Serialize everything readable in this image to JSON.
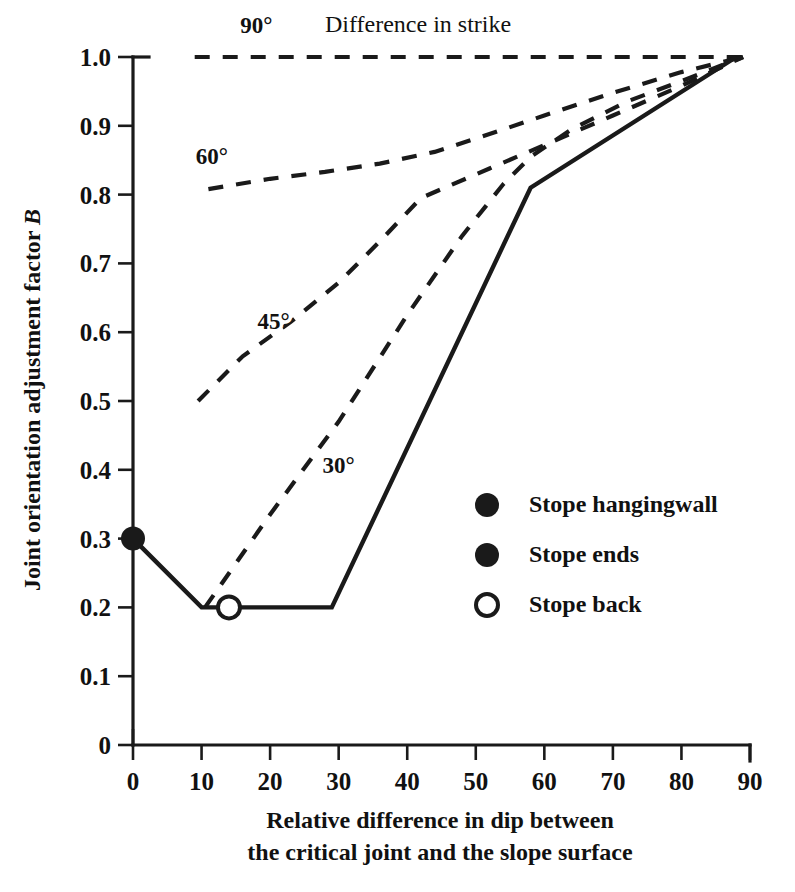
{
  "chart_data": {
    "type": "line",
    "title": "",
    "xlabel": "Relative difference in dip between the critical joint and the slope surface",
    "xlabel_line1": "Relative difference in dip between",
    "xlabel_line2": "the critical joint and the slope surface",
    "ylabel": "Joint orientation adjustment factor B",
    "ylabel_text": "Joint orientation adjustment factor ",
    "ylabel_symbol": "B",
    "xlim": [
      0,
      90
    ],
    "ylim": [
      0,
      1.0
    ],
    "xticks": [
      0,
      10,
      20,
      30,
      40,
      50,
      60,
      70,
      80,
      90
    ],
    "xtick_labels": [
      "0",
      "10",
      "20",
      "30",
      "40",
      "50",
      "60",
      "70",
      "80",
      "90"
    ],
    "yticks": [
      0,
      0.1,
      0.2,
      0.3,
      0.4,
      0.5,
      0.6,
      0.7,
      0.8,
      0.9,
      1.0
    ],
    "ytick_labels": [
      "0",
      "0.1",
      "0.2",
      "0.3",
      "0.4",
      "0.5",
      "0.6",
      "0.7",
      "0.8",
      "0.9",
      "1.0"
    ],
    "grid": false,
    "legend_position": "center-right",
    "annotation": "Difference in strike",
    "series": [
      {
        "name": "90°",
        "label": "90°",
        "style": "dashed",
        "label_x": 18,
        "label_y": 1.035,
        "points": [
          [
            9,
            1.0
          ],
          [
            20,
            1.0
          ],
          [
            30,
            1.0
          ],
          [
            40,
            1.0
          ],
          [
            50,
            1.0
          ],
          [
            60,
            1.0
          ],
          [
            70,
            1.0
          ],
          [
            80,
            1.0
          ],
          [
            89,
            1.0
          ]
        ]
      },
      {
        "name": "60°",
        "label": "60°",
        "style": "dashed",
        "label_x": 11.5,
        "label_y": 0.845,
        "points": [
          [
            11,
            0.808
          ],
          [
            20,
            0.823
          ],
          [
            28,
            0.833
          ],
          [
            36,
            0.845
          ],
          [
            44,
            0.862
          ],
          [
            52,
            0.888
          ],
          [
            60,
            0.915
          ],
          [
            70,
            0.948
          ],
          [
            80,
            0.978
          ],
          [
            89,
            1.0
          ]
        ]
      },
      {
        "name": "45°",
        "label": "45°",
        "style": "dashed",
        "label_x": 20.5,
        "label_y": 0.605,
        "points": [
          [
            9.5,
            0.5
          ],
          [
            16,
            0.565
          ],
          [
            23,
            0.615
          ],
          [
            30,
            0.672
          ],
          [
            36,
            0.732
          ],
          [
            42,
            0.795
          ],
          [
            45,
            0.808
          ],
          [
            52,
            0.838
          ],
          [
            60,
            0.872
          ],
          [
            70,
            0.915
          ],
          [
            80,
            0.958
          ],
          [
            89,
            1.0
          ]
        ]
      },
      {
        "name": "30°",
        "label": "30°",
        "style": "dashed",
        "label_x": 30,
        "label_y": 0.395,
        "points": [
          [
            10.5,
            0.2
          ],
          [
            20,
            0.335
          ],
          [
            30,
            0.47
          ],
          [
            40,
            0.625
          ],
          [
            48,
            0.74
          ],
          [
            54,
            0.815
          ],
          [
            58,
            0.855
          ],
          [
            64,
            0.895
          ],
          [
            72,
            0.935
          ],
          [
            80,
            0.965
          ],
          [
            89,
            1.0
          ]
        ]
      },
      {
        "name": "Stope boundary",
        "label": "",
        "style": "solid",
        "points": [
          [
            0,
            0.3
          ],
          [
            10,
            0.2
          ],
          [
            29,
            0.2
          ],
          [
            58,
            0.81
          ],
          [
            88,
            1.0
          ]
        ]
      }
    ],
    "markers": [
      {
        "name": "hangingwall-marker",
        "x": 0,
        "y": 0.3,
        "fill": "filled"
      },
      {
        "name": "stope-back-marker",
        "x": 14,
        "y": 0.2,
        "fill": "open"
      }
    ],
    "legend": [
      {
        "label": "Stope hangingwall",
        "marker": "filled-circle"
      },
      {
        "label": "Stope ends",
        "marker": "filled-circle"
      },
      {
        "label": "Stope back",
        "marker": "open-circle"
      }
    ],
    "colors": {
      "ink": "#1a1a1a",
      "background": "#ffffff"
    }
  }
}
